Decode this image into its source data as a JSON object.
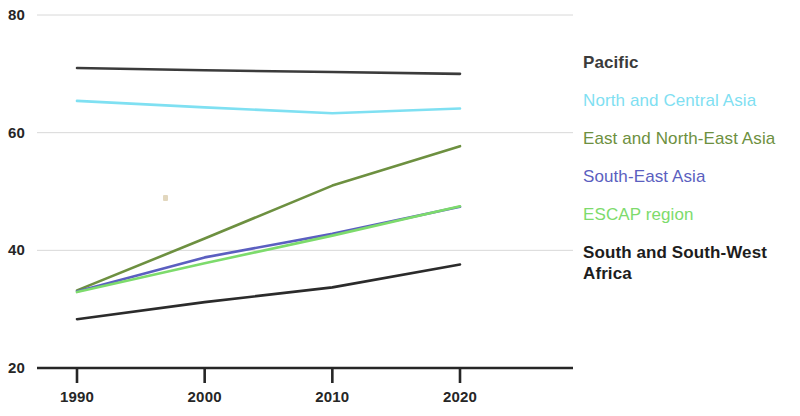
{
  "chart_data": {
    "type": "line",
    "title": "",
    "subtitle": "",
    "xlabel": "",
    "ylabel": "",
    "x": [
      1990,
      2000,
      2010,
      2020
    ],
    "xlim": [
      1988,
      2026
    ],
    "ylim": [
      20,
      80
    ],
    "xticks": [
      "1990",
      "2000",
      "2010",
      "2020"
    ],
    "yticks": [
      "20",
      "40",
      "60",
      "80"
    ],
    "grid": true,
    "legend_position": "right",
    "series": [
      {
        "name": "Pacific",
        "color": "#3b3b3b",
        "bold_label": true,
        "values": [
          71.0,
          70.6,
          70.3,
          70.0
        ]
      },
      {
        "name": "North and Central Asia",
        "color": "#7fe0f2",
        "bold_label": false,
        "values": [
          65.4,
          64.3,
          63.3,
          64.1
        ]
      },
      {
        "name": "East and North-East Asia",
        "color": "#6d9040",
        "bold_label": false,
        "values": [
          33.2,
          42.0,
          51.0,
          57.7
        ]
      },
      {
        "name": "South-East Asia",
        "color": "#5b5fc0",
        "bold_label": false,
        "values": [
          33.0,
          38.8,
          42.8,
          47.4
        ]
      },
      {
        "name": "ESCAP region",
        "color": "#7ddb6c",
        "bold_label": false,
        "values": [
          32.9,
          37.8,
          42.5,
          47.5
        ]
      },
      {
        "name": "South and South-West Africa",
        "color": "#2b2b2b",
        "bold_label": true,
        "values": [
          28.3,
          31.2,
          33.7,
          37.6
        ]
      }
    ],
    "legend_entries": [
      "Pacific",
      "North and Central Asia",
      "East and North-East Asia",
      "South-East Asia",
      "ESCAP region",
      "South and South-West Africa"
    ],
    "axis_color": "#262626",
    "grid_color": "#d8d8d8"
  }
}
